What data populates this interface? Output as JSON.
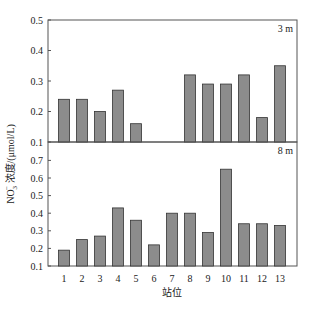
{
  "chart_data": {
    "type": "bar",
    "layout": "two vertically stacked panels sharing x-axis",
    "xlabel": "站位",
    "ylabel": "NO3⁻浓度/(μmol/L)",
    "ylabel_parts": {
      "prefix": "NO",
      "sub": "3",
      "sup": "−",
      "suffix": " 浓度/(μmol/L)"
    },
    "categories": [
      "1",
      "2",
      "3",
      "4",
      "5",
      "6",
      "7",
      "8",
      "9",
      "10",
      "11",
      "12",
      "13"
    ],
    "bar_color": "#8c8c8c",
    "bar_edge_color": "#333333",
    "grid": false,
    "panels": [
      {
        "name": "3 m",
        "label": "3 m",
        "ylim": [
          0.1,
          0.5
        ],
        "yticks": [
          "0.1",
          "0.2",
          "0.3",
          "0.4",
          "0.5"
        ],
        "values": [
          0.24,
          0.24,
          0.2,
          0.27,
          0.16,
          null,
          null,
          0.32,
          0.29,
          0.29,
          0.32,
          0.18,
          0.35
        ]
      },
      {
        "name": "8 m",
        "label": "8 m",
        "ylim": [
          0.1,
          0.8
        ],
        "yticks": [
          "0.1",
          "0.2",
          "0.3",
          "0.4",
          "0.5",
          "0.6",
          "0.7"
        ],
        "values": [
          0.19,
          0.25,
          0.27,
          0.43,
          0.36,
          0.22,
          0.4,
          0.4,
          0.29,
          0.65,
          0.34,
          0.34,
          0.33
        ]
      }
    ]
  }
}
